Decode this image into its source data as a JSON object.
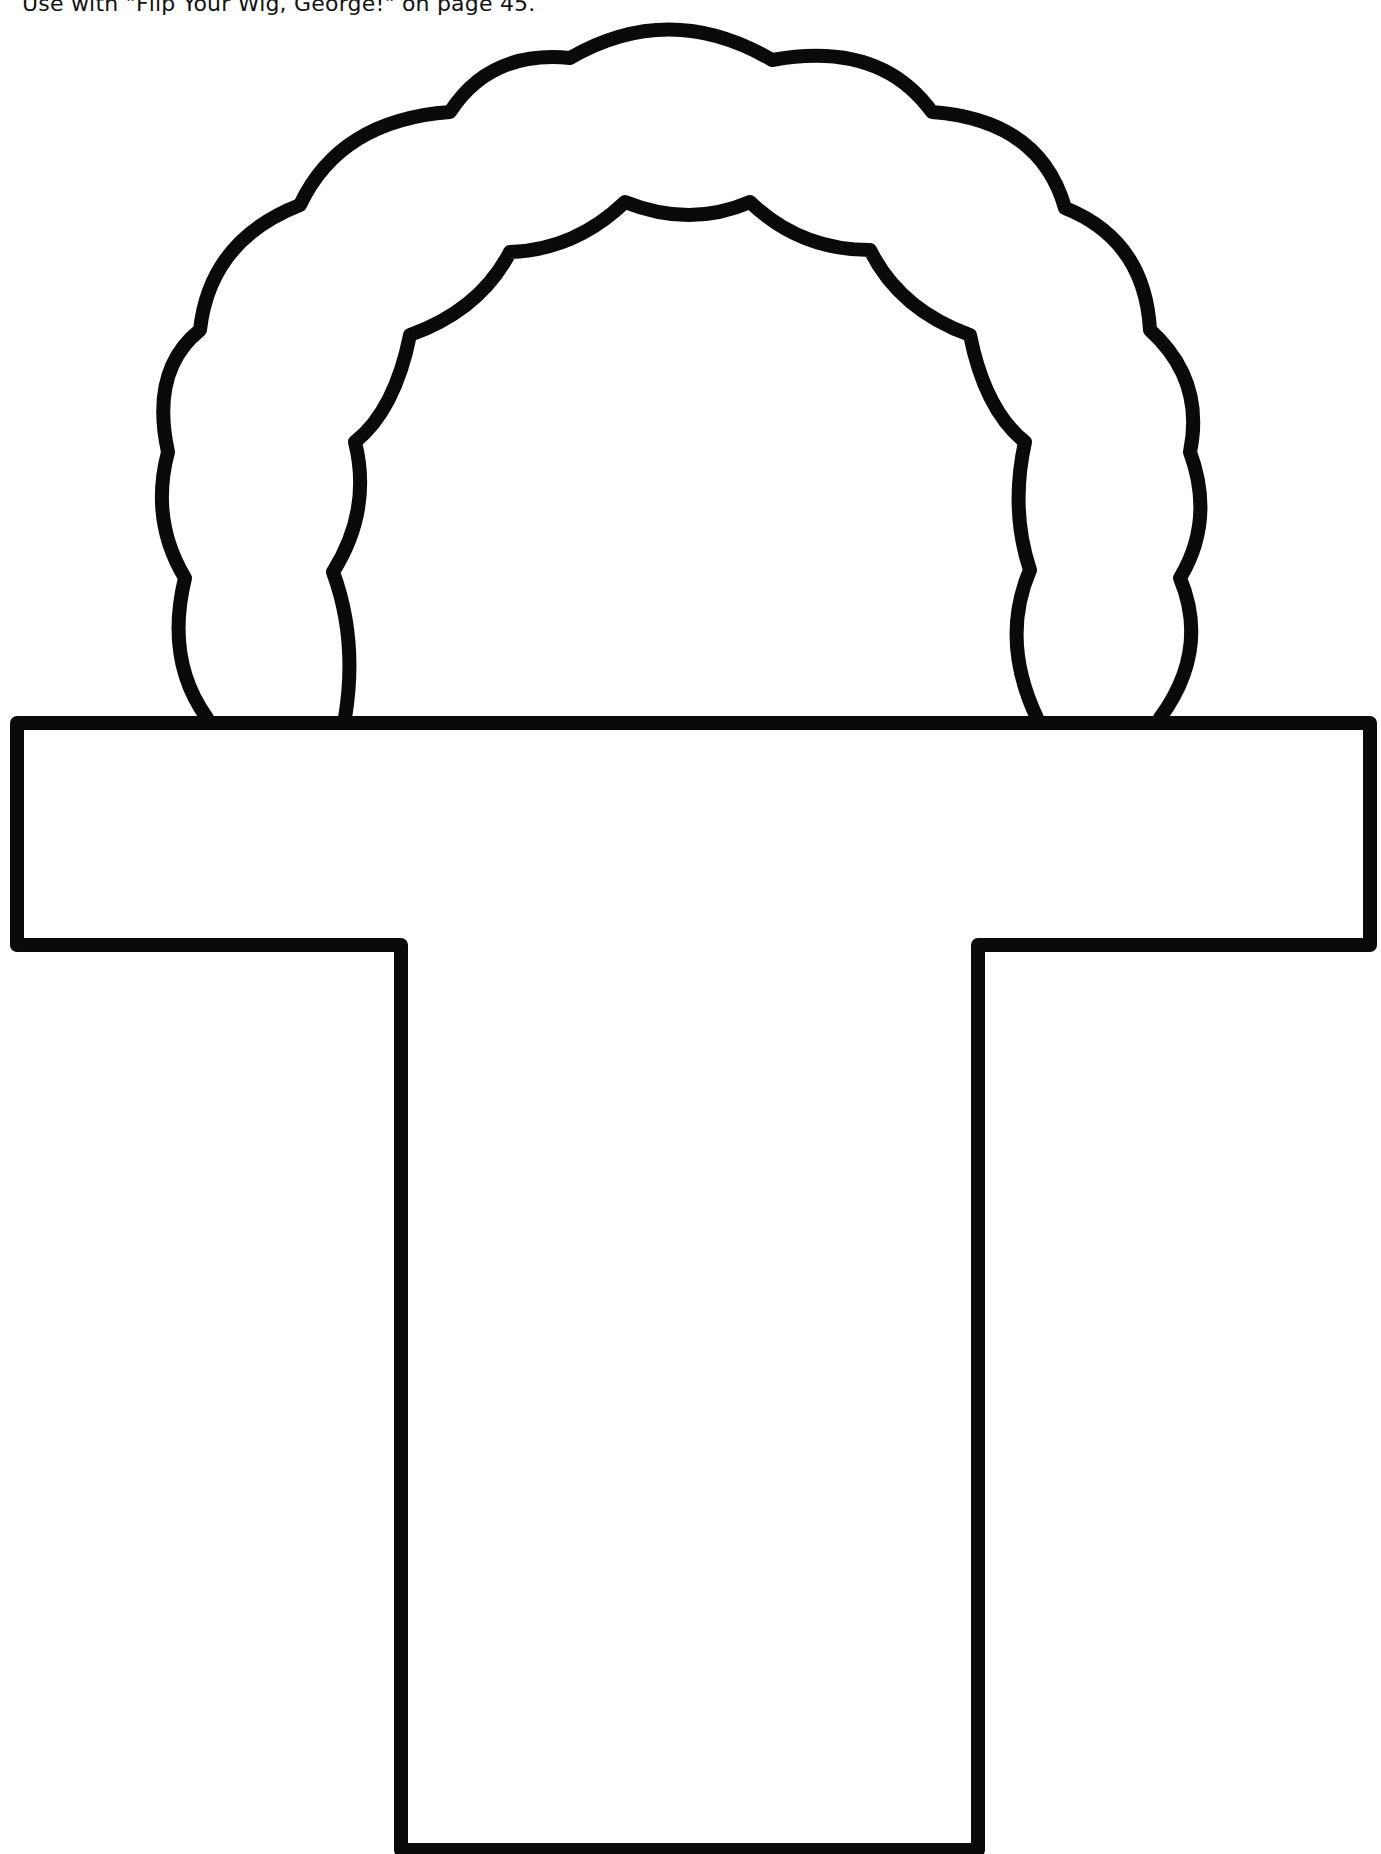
{
  "page": {
    "caption": "Use with \"Flip Your Wig, George!\" on page 45.",
    "background_color": "#ffffff",
    "stroke_color": "#0a0a0a"
  },
  "figure": {
    "parts": [
      {
        "name": "wig-arch",
        "style": "scalloped outline, open bottom resting on the crossbar"
      },
      {
        "name": "t-crossbar",
        "style": "rectangle outline"
      },
      {
        "name": "t-stem",
        "style": "tall rectangle outline extending to bottom of page"
      }
    ]
  }
}
